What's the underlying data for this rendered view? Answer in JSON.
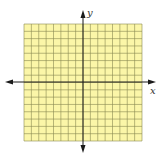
{
  "diagram": {
    "type": "coordinate-grid",
    "grid": {
      "columns": 16,
      "rows": 16,
      "fill_color": "#fbf6a8",
      "line_color": "#8a8a52",
      "left": 24,
      "top": 24,
      "right": 142,
      "bottom": 141
    },
    "axes": {
      "color": "#1a1a1a",
      "x_label": "x",
      "y_label": "y",
      "x_axis_y": 82,
      "y_axis_x": 83
    }
  }
}
